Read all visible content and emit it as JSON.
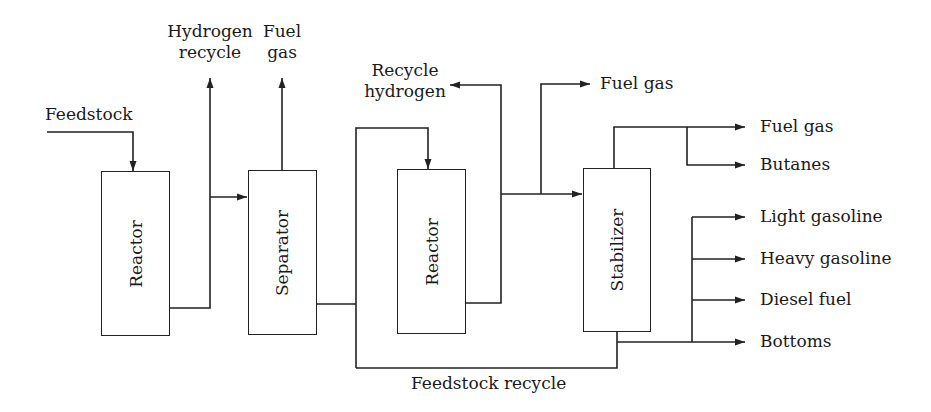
{
  "diagram": {
    "type": "process-flow",
    "units": [
      {
        "id": "reactor-1",
        "label": "Reactor"
      },
      {
        "id": "separator",
        "label": "Separator"
      },
      {
        "id": "reactor-2",
        "label": "Reactor"
      },
      {
        "id": "stabilizer",
        "label": "Stabilizer"
      }
    ],
    "streams": {
      "feedstock": "Feedstock",
      "hydrogen_recycle_line1": "Hydrogen",
      "hydrogen_recycle_line2": "recycle",
      "fuel_gas_separator_line1": "Fuel",
      "fuel_gas_separator_line2": "gas",
      "recycle_hydrogen_line1": "Recycle",
      "recycle_hydrogen_line2": "hydrogen",
      "fuel_gas_reactor2": "Fuel gas",
      "feedstock_recycle": "Feedstock recycle"
    },
    "products": [
      "Fuel gas",
      "Butanes",
      "Light gasoline",
      "Heavy gasoline",
      "Diesel fuel",
      "Bottoms"
    ],
    "line_color": "#222222"
  }
}
